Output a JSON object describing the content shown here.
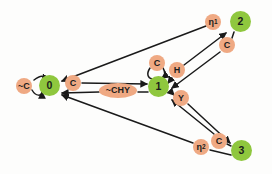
{
  "diagram": {
    "type": "state-machine-graph",
    "background_color": "#fdfdfc",
    "state_color": "#8fc73e",
    "label_color": "#efa983",
    "edge_color": "#1a1a1a",
    "states": [
      {
        "id": "s0",
        "label": "0",
        "x": 50,
        "y": 86
      },
      {
        "id": "s1",
        "label": "1",
        "x": 159,
        "y": 87
      },
      {
        "id": "s2",
        "label": "2",
        "x": 241,
        "y": 22
      },
      {
        "id": "s3",
        "label": "3",
        "x": 242,
        "y": 151
      }
    ],
    "edge_labels": [
      {
        "id": "l_notC_self0",
        "text": "~C",
        "x": 24,
        "y": 86,
        "shape": "circle"
      },
      {
        "id": "l_C_0_to_1",
        "text": "C",
        "x": 73,
        "y": 83,
        "shape": "circle"
      },
      {
        "id": "l_notCHY_1_to_0",
        "text": "~CHY",
        "x": 118,
        "y": 90,
        "shape": "ellipse"
      },
      {
        "id": "l_C_self1",
        "text": "C",
        "x": 157,
        "y": 63,
        "shape": "circle"
      },
      {
        "id": "l_H_1_to_2",
        "text": "H",
        "x": 177,
        "y": 70,
        "shape": "circle"
      },
      {
        "id": "l_Y_1_to_3",
        "text": "Y",
        "x": 181,
        "y": 98,
        "shape": "circle"
      },
      {
        "id": "l_eta1_2_to_0",
        "text": "η",
        "sub": "1",
        "x": 213,
        "y": 22,
        "shape": "circle"
      },
      {
        "id": "l_C_self2",
        "text": "C",
        "x": 227,
        "y": 45,
        "shape": "circle"
      },
      {
        "id": "l_eta2_3_to_0",
        "text": "η",
        "sub": "2",
        "x": 201,
        "y": 147,
        "shape": "circle"
      },
      {
        "id": "l_C_self3",
        "text": "C",
        "x": 219,
        "y": 141,
        "shape": "circle"
      }
    ],
    "edges": [
      {
        "id": "e_self0",
        "from": "s0",
        "to": "s0",
        "label": "~C"
      },
      {
        "id": "e_0_1",
        "from": "s0",
        "to": "s1",
        "label": "C"
      },
      {
        "id": "e_1_0",
        "from": "s1",
        "to": "s0",
        "label": "~CHY"
      },
      {
        "id": "e_self1",
        "from": "s1",
        "to": "s1",
        "label": "C"
      },
      {
        "id": "e_1_2",
        "from": "s1",
        "to": "s2",
        "label": "H"
      },
      {
        "id": "e_1_3",
        "from": "s1",
        "to": "s3",
        "label": "Y"
      },
      {
        "id": "e_2_0",
        "from": "s2",
        "to": "s0",
        "label": "η1"
      },
      {
        "id": "e_2_1",
        "from": "s2",
        "to": "s1",
        "label": "C"
      },
      {
        "id": "e_3_0",
        "from": "s3",
        "to": "s0",
        "label": "η2"
      },
      {
        "id": "e_3_1",
        "from": "s3",
        "to": "s1",
        "label": "C"
      }
    ]
  }
}
